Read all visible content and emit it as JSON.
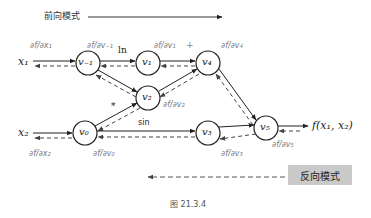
{
  "forward_mode": {
    "label": "前向模式"
  },
  "reverse_mode": {
    "label": "反向模式"
  },
  "caption": "图 21.3.4",
  "inputs": {
    "x1": "x₁",
    "x2": "x₂"
  },
  "output": {
    "label": "f(x₁, x₂)"
  },
  "nodes": {
    "vm1": "v₋₁",
    "v0": "v₀",
    "v1": "v₁",
    "v2": "v₂",
    "v3": "v₃",
    "v4": "v₄",
    "v5": "v₅"
  },
  "operations": {
    "ln": "ln",
    "plus": "+",
    "mult": "*",
    "sin": "sin"
  },
  "derivatives": {
    "dx1": "∂f/∂x₁",
    "dvm1": "∂f/∂v₋₁",
    "dv1": "∂f/∂v₁",
    "dv4": "∂f/∂v₄",
    "dv2": "∂f/∂v₂",
    "dv5": "∂f/∂v₅",
    "dx2": "∂f/∂x₂",
    "dv0": "∂f/∂v₀",
    "dv3": "∂f/∂v₃"
  },
  "colors": {
    "edge": "#222222",
    "dashed": "#444444",
    "reverse_box": "#c9c9c9"
  }
}
